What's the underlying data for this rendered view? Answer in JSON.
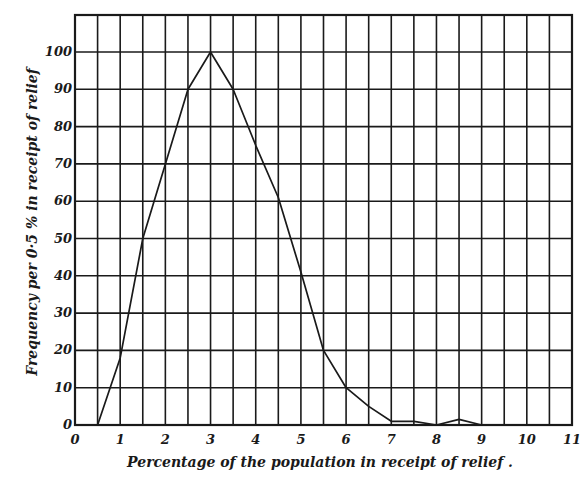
{
  "chart_data": {
    "type": "line",
    "title": "",
    "xlabel": "Percentage of the population in receipt of relief .",
    "ylabel": "Frequency per 0·5 % in receipt of relief",
    "xlim": [
      0,
      11
    ],
    "ylim": [
      0,
      110
    ],
    "x_ticks": [
      "0",
      "1",
      "2",
      "3",
      "4",
      "5",
      "6",
      "7",
      "8",
      "9",
      "10",
      "11"
    ],
    "y_ticks": [
      "0",
      "10",
      "20",
      "30",
      "40",
      "50",
      "60",
      "70",
      "80",
      "90",
      "100"
    ],
    "grid": {
      "x_step": 0.5,
      "y_step": 10,
      "on": true
    },
    "legend": null,
    "series": [
      {
        "name": "Frequency",
        "x": [
          0.5,
          1,
          1.5,
          2,
          2.5,
          3,
          3.5,
          4,
          4.5,
          5,
          5.5,
          6,
          6.5,
          7,
          7.5,
          8,
          8.5,
          9
        ],
        "values": [
          0,
          18,
          50,
          70,
          90,
          100,
          90,
          75,
          61,
          41,
          20,
          10,
          5,
          1,
          1,
          0,
          1.5,
          0
        ]
      }
    ],
    "colors": {
      "ink": "#1a1a1a",
      "background": "#ffffff"
    }
  }
}
